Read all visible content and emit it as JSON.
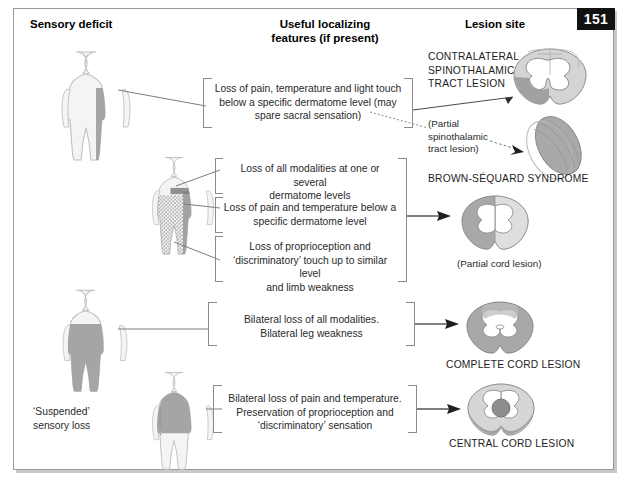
{
  "page": {
    "number": "151",
    "width": 629,
    "height": 489
  },
  "headers": {
    "sensory": "Sensory deficit",
    "useful_line1": "Useful localizing",
    "useful_line2": "features (if present)",
    "lesion": "Lesion site"
  },
  "rows": [
    {
      "id": "spinothalamic",
      "features": [
        "Loss of pain, temperature and light touch below a specific dermatome level (may spare sacral sensation)"
      ],
      "lesion_label": "CONTRALATERAL SPINOTHALAMIC TRACT LESION",
      "lesion_label_lines": [
        "CONTRALATERAL",
        "SPINOTHALAMIC",
        "TRACT LESION"
      ],
      "secondary_label_lines": [
        "(Partial",
        "spinothalamic",
        "tract lesion)"
      ]
    },
    {
      "id": "brown-sequard",
      "features": [
        "Loss of all modalities at one or several dermatome levels",
        "Loss of pain and temperature below a specific dermatome level",
        "Loss of proprioception and ‘discriminatory’ touch up to similar level and limb weakness"
      ],
      "lesion_label": "BROWN-SÉQUARD SYNDROME",
      "lesion_caption": "(Partial cord lesion)"
    },
    {
      "id": "complete-cord",
      "features": [
        "Bilateral loss of all modalities. Bilateral leg weakness"
      ],
      "lesion_label": "COMPLETE CORD LESION"
    },
    {
      "id": "central-cord",
      "features": [
        "Bilateral loss of pain and temperature. Preservation of proprioception and ‘discriminatory’ sensation"
      ],
      "lesion_label": "CENTRAL CORD LESION",
      "body_note_lines": [
        "‘Suspended’",
        "sensory loss"
      ]
    }
  ],
  "feature_text": {
    "f1_l1": "Loss of pain, temperature and light touch",
    "f1_l2": "below a specific dermatome level (may",
    "f1_l3": "spare sacral sensation)",
    "f2_l1": "Loss of all modalities at one or several",
    "f2_l2": "dermatome levels",
    "f3_l1": "Loss of pain and temperature below a",
    "f3_l2": "specific dermatome level",
    "f4_l1": "Loss of proprioception and",
    "f4_l2": "‘discriminatory’ touch up to similar level",
    "f4_l3": "and limb weakness",
    "f5_l1": "Bilateral loss of all modalities.",
    "f5_l2": "Bilateral leg weakness",
    "f6_l1": "Bilateral loss of pain and temperature.",
    "f6_l2": "Preservation of proprioception and",
    "f6_l3": "‘discriminatory’ sensation"
  },
  "lesion_text": {
    "l1_a": "CONTRALATERAL",
    "l1_b": "SPINOTHALAMIC",
    "l1_c": "TRACT LESION",
    "p1_a": "(Partial",
    "p1_b": "spinothalamic",
    "p1_c": "tract lesion)",
    "bs": "BROWN-SÉQUARD SYNDROME",
    "partial_cord": "(Partial cord lesion)",
    "complete": "COMPLETE CORD LESION",
    "central": "CENTRAL CORD LESION"
  },
  "body_notes": {
    "suspended_a": "‘Suspended’",
    "suspended_b": "sensory loss"
  },
  "colors": {
    "page_chip_bg": "#111111",
    "page_chip_text": "#ffffff",
    "frame_border": "#9a9a9a",
    "line": "#7d7d7d",
    "bracket": "#8a8a8a",
    "body_outline": "#b9b9b9",
    "body_fill": "#f4f4f4",
    "deficit_dark": "#8f8f8f",
    "deficit_mid": "#b0b0b0",
    "cord_gray": "#a8a8a8",
    "cord_light": "#d8d8d8",
    "text": "#2a2a2a"
  }
}
